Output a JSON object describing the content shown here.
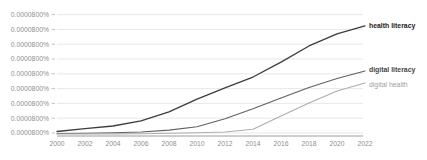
{
  "chart_data": {
    "type": "line",
    "title": "",
    "xlabel": "",
    "ylabel": "",
    "x": [
      2000,
      2002,
      2004,
      2006,
      2008,
      2010,
      2012,
      2014,
      2016,
      2018,
      2020,
      2022
    ],
    "x_tick_labels": [
      "2000",
      "2002",
      "2004",
      "2006",
      "2008",
      "2010",
      "2012",
      "2014",
      "2016",
      "2018",
      "2020",
      "2022"
    ],
    "y_tick_labels": [
      "0.0000800%",
      "0.0000800%",
      "0.0000800%",
      "0.0000800%",
      "0.0000800%",
      "0.0000800%",
      "0.0000800%",
      "0.0000800%",
      "0.0000800%"
    ],
    "y_unit_per_gridline": "0.0000100%",
    "ylim": [
      0,
      8
    ],
    "grid": true,
    "legend_position": "line-end-labels-right",
    "series": [
      {
        "name": "health literacy",
        "color": "#3d3d3d",
        "label_color": "#1c1c1c",
        "bold": true,
        "stroke_width": 1.3,
        "values": [
          0.17,
          0.37,
          0.54,
          0.88,
          1.49,
          2.36,
          3.11,
          3.85,
          4.86,
          5.95,
          6.76,
          7.3
        ]
      },
      {
        "name": "digital literacy",
        "color": "#616161",
        "label_color": "#474747",
        "bold": true,
        "stroke_width": 1.1,
        "values": [
          0.03,
          0.05,
          0.08,
          0.14,
          0.26,
          0.49,
          1.03,
          1.7,
          2.43,
          3.14,
          3.75,
          4.26
        ]
      },
      {
        "name": "digital health",
        "color": "#adadad",
        "label_color": "#9e9e9e",
        "bold": false,
        "stroke_width": 1.1,
        "values": [
          0.0,
          0.0,
          0.01,
          0.02,
          0.05,
          0.08,
          0.14,
          0.32,
          1.22,
          2.09,
          2.91,
          3.45
        ]
      }
    ]
  },
  "colors": {
    "background": "#ffffff",
    "gridline": "#e8e8e8",
    "axis": "#9c9c9c",
    "tick_text": "#8f8f8f"
  }
}
